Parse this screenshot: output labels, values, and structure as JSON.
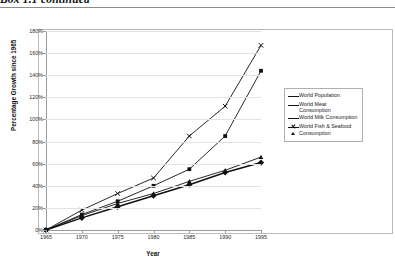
{
  "header": {
    "caption": "Box 1.1 continued"
  },
  "chart_data": {
    "type": "line",
    "title": "",
    "xlabel": "Year",
    "ylabel": "Percentage Growth since 1965",
    "x": [
      1965,
      1970,
      1975,
      1980,
      1985,
      1990,
      1995
    ],
    "xtick_labels": [
      "1965",
      "1970",
      "1975",
      "1980",
      "1985",
      "1990",
      "1995"
    ],
    "ytick_labels": [
      "0%",
      "20%",
      "40%",
      "60%",
      "80%",
      "100%",
      "120%",
      "140%",
      "160%",
      "180%"
    ],
    "ytick_values": [
      0,
      20,
      40,
      60,
      80,
      100,
      120,
      140,
      160,
      180
    ],
    "xlim": [
      1965,
      1995
    ],
    "ylim": [
      0,
      180
    ],
    "grid": true,
    "legend_position": "right",
    "series": [
      {
        "name": "World Population",
        "marker": "diamond",
        "values": [
          0,
          11,
          21,
          31,
          41,
          52,
          61
        ]
      },
      {
        "name": "World Meat Consumption",
        "marker": "square",
        "values": [
          0,
          14,
          26,
          40,
          55,
          85,
          144
        ]
      },
      {
        "name": "World Milk Consumption",
        "marker": "triangle",
        "values": [
          0,
          13,
          24,
          33,
          44,
          54,
          66
        ]
      },
      {
        "name": "World Fish & Seafood Consumption",
        "marker": "cross",
        "values": [
          0,
          18,
          33,
          47,
          85,
          112,
          167
        ]
      }
    ]
  }
}
